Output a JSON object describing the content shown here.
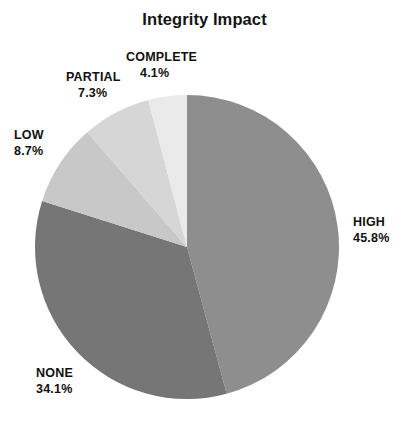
{
  "chart_data": {
    "type": "pie",
    "title": "Integrity Impact",
    "xlabel": "",
    "ylabel": "",
    "legend_position": "none",
    "grid": false,
    "labels": [
      "HIGH",
      "NONE",
      "LOW",
      "PARTIAL",
      "COMPLETE"
    ],
    "values": [
      45.8,
      34.1,
      8.7,
      7.3,
      4.1
    ],
    "value_unit": "%",
    "start_angle_deg": 0,
    "direction": "clockwise",
    "slices": [
      {
        "label": "HIGH",
        "percent": "45.8%",
        "value": 45.8,
        "color": "#8e8e8e"
      },
      {
        "label": "NONE",
        "percent": "34.1%",
        "value": 34.1,
        "color": "#767676"
      },
      {
        "label": "LOW",
        "percent": "8.7%",
        "value": 8.7,
        "color": "#c8c8c8"
      },
      {
        "label": "PARTIAL",
        "percent": "7.3%",
        "value": 7.3,
        "color": "#d6d6d6"
      },
      {
        "label": "COMPLETE",
        "percent": "4.1%",
        "value": 4.1,
        "color": "#eaeaea"
      }
    ]
  },
  "colors": {
    "background": "#ffffff",
    "text": "#111111",
    "title": "#141414"
  }
}
